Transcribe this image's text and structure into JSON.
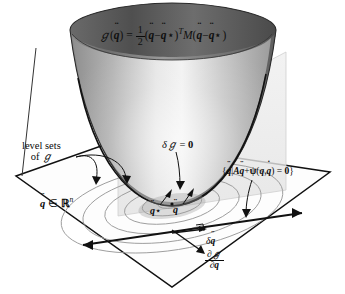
{
  "figure": {
    "background_color": "#ffffff",
    "ink_color": "#0a0a0a"
  },
  "labels": {
    "objective_formula": {
      "G": "ℊ",
      "arg_open": "(",
      "qddot": "q",
      "arg_close": ")",
      "equals": "=",
      "frac_num": "1",
      "frac_den": "2",
      "group1_open": "(",
      "minus": "−",
      "star": "⋆",
      "group1_close": ")",
      "transpose": "T",
      "M": "M",
      "full_text": "ℊ(q̈) = ½(q̈ − q̈⋆)ᵀ M(q̈ − q̈⋆)"
    },
    "level_sets": {
      "line1": "level sets",
      "line2_of": "of",
      "line2_G": "ℊ"
    },
    "domain": {
      "qddot": "q",
      "in": "∈",
      "space": "ℝ",
      "exponent": "n",
      "full_text": "q̈ ∈ ℝⁿ"
    },
    "variation_zero": {
      "delta": "δ",
      "G": "ℊ",
      "equals": "=",
      "zero": "0",
      "full_text": "δℊ = 0"
    },
    "constraint_set": {
      "brace_open": "{",
      "qddot": "q",
      "bar": "|",
      "A": "A",
      "qddot2": "q",
      "plus": "+",
      "psi": "ψ",
      "paren_open": "(",
      "q": "q",
      "comma": ",",
      "qdot": "q",
      "paren_close": ")",
      "equals": "=",
      "zero": "0",
      "brace_close": "}",
      "full_text": "{q̈ | A q̈ + ψ(q, q̇) = 0}"
    },
    "q_star": {
      "qddot": "q",
      "star": "⋆",
      "full_text": "q̈⋆"
    },
    "q_point": {
      "qddot": "q",
      "full_text": "q̈"
    },
    "delta_qddot": {
      "delta": "δ",
      "qddot": "q",
      "full_text": "δq̈"
    },
    "gradient": {
      "num_partial": "∂",
      "num_G": "ℊ",
      "den_partial": "∂",
      "den_qddot": "q",
      "full_text": "∂ℊ/∂q̈"
    }
  }
}
